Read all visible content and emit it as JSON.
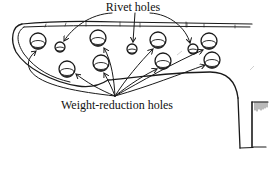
{
  "diagram": {
    "type": "annotated-sketch",
    "labels": {
      "top": "Rivet holes",
      "bottom": "Weight-reduction holes"
    },
    "colors": {
      "ink": "#1a1a1a",
      "background": "#ffffff"
    },
    "rivet_holes": [
      {
        "id": "rivet-1",
        "x": 60,
        "y": 47,
        "r": 5
      },
      {
        "id": "rivet-2",
        "x": 132,
        "y": 49,
        "r": 5
      },
      {
        "id": "rivet-3",
        "x": 193,
        "y": 49,
        "r": 5
      }
    ],
    "weight_reduction_holes": [
      {
        "id": "wr-1",
        "x": 38,
        "y": 41,
        "r": 8
      },
      {
        "id": "wr-2",
        "x": 67,
        "y": 69,
        "r": 8
      },
      {
        "id": "wr-3",
        "x": 98,
        "y": 38,
        "r": 8
      },
      {
        "id": "wr-4",
        "x": 101,
        "y": 63,
        "r": 8
      },
      {
        "id": "wr-5",
        "x": 158,
        "y": 40,
        "r": 8
      },
      {
        "id": "wr-6",
        "x": 163,
        "y": 61,
        "r": 8
      },
      {
        "id": "wr-7",
        "x": 209,
        "y": 41,
        "r": 8
      },
      {
        "id": "wr-8",
        "x": 212,
        "y": 60,
        "r": 8
      }
    ],
    "rivet_arrow_origin": {
      "x": 133,
      "y": 12
    },
    "weight_arrow_origin": {
      "x": 115,
      "y": 96
    }
  }
}
